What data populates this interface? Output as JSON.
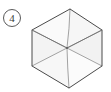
{
  "figure": {
    "label": {
      "text": "4",
      "style": "circled-numeral",
      "icon_name": "circled-number-label",
      "center_x": 12,
      "center_y": 18,
      "radius": 8.5,
      "stroke_color": "#555555",
      "text_color": "#3a3a3a"
    },
    "shape": {
      "name": "hexagon-wireframe",
      "type": "hexagon",
      "description": "hexagon with six spokes from center to each vertex",
      "vertices": [
        {
          "name": "top",
          "x": 70,
          "y": 9
        },
        {
          "name": "upper-right",
          "x": 102,
          "y": 30
        },
        {
          "name": "lower-right",
          "x": 102,
          "y": 66
        },
        {
          "name": "bottom",
          "x": 69,
          "y": 88
        },
        {
          "name": "lower-left",
          "x": 32,
          "y": 66
        },
        {
          "name": "upper-left",
          "x": 32,
          "y": 30
        }
      ],
      "center": {
        "x": 67,
        "y": 48
      },
      "outline_color": "#4a4a4a",
      "spoke_color": "#8a8a8a",
      "fill_color": "#fbfbfb",
      "face_tint_color": "#f4f4f4",
      "outline_width": 1,
      "spoke_width": 0.8,
      "spoke_count": 6
    },
    "background_color": "#ffffff",
    "canvas": {
      "width": 111,
      "height": 92
    }
  }
}
